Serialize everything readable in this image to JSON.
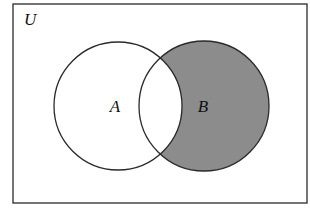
{
  "diagram": {
    "type": "venn",
    "universe": {
      "label": "U",
      "rect": {
        "x": 13,
        "y": 4,
        "width": 294,
        "height": 199
      }
    },
    "sets": [
      {
        "label": "A",
        "cx": 118,
        "cy": 106,
        "r": 64,
        "label_x": 115,
        "label_y": 112
      },
      {
        "label": "B",
        "cx": 204,
        "cy": 106,
        "r": 65,
        "label_x": 203,
        "label_y": 112
      }
    ],
    "shaded_region": "B \\ A",
    "colors": {
      "background": "#ffffff",
      "outline": "#2a2a2a",
      "shade": "#8c8c8c"
    }
  }
}
